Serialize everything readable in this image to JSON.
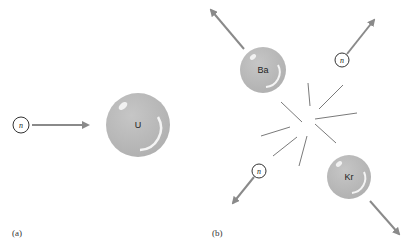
{
  "panels": {
    "a": {
      "label": "(a)",
      "neutron": {
        "label": "n"
      },
      "nucleus": {
        "label": "U"
      }
    },
    "b": {
      "label": "(b)",
      "fragments": [
        {
          "label": "Ba"
        },
        {
          "label": "Kr"
        }
      ],
      "neutrons": [
        {
          "label": "n"
        },
        {
          "label": "n"
        }
      ]
    }
  },
  "colors": {
    "sphere": "#b8b8b8",
    "arrow": "#8a8a8a",
    "burst": "#7a7a7a",
    "neutron_outline": "#333333"
  }
}
